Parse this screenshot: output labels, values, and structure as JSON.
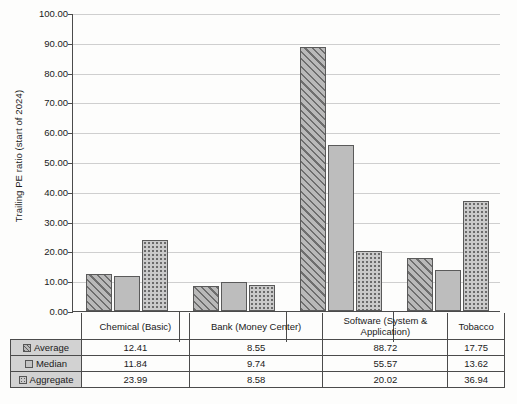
{
  "chart_data": {
    "type": "bar",
    "title": "",
    "xlabel": "",
    "ylabel": "Trailing PE ratio (start of 2024)",
    "ylim": [
      0,
      100
    ],
    "ytick_values": [
      0,
      10,
      20,
      30,
      40,
      50,
      60,
      70,
      80,
      90,
      100
    ],
    "ytick_labels": [
      "0.00",
      "10.00",
      "20.00",
      "30.00",
      "40.00",
      "50.00",
      "60.00",
      "70.00",
      "80.00",
      "90.00",
      "100.00"
    ],
    "grid": true,
    "legend_position": "table-below",
    "categories": [
      "Chemical (Basic)",
      "Bank (Money Center)",
      "Software (System & Application)",
      "Tobacco"
    ],
    "category_lines": [
      [
        "Chemical (Basic)"
      ],
      [
        "Bank (Money Center)"
      ],
      [
        "Software (System &",
        "Application)"
      ],
      [
        "Tobacco"
      ]
    ],
    "series": [
      {
        "name": "Average",
        "pattern": "diagonal-hatch",
        "color": "#b9b9b9",
        "values": [
          12.41,
          8.55,
          88.72,
          17.75
        ],
        "labels": [
          "12.41",
          "8.55",
          "88.72",
          "17.75"
        ]
      },
      {
        "name": "Median",
        "pattern": "solid-gray",
        "color": "#bdbdbd",
        "values": [
          11.84,
          9.74,
          55.57,
          13.62
        ],
        "labels": [
          "11.84",
          "9.74",
          "55.57",
          "13.62"
        ]
      },
      {
        "name": "Aggregate",
        "pattern": "dotted",
        "color": "#cacaca",
        "values": [
          23.99,
          8.58,
          20.02,
          36.94
        ],
        "labels": [
          "23.99",
          "8.58",
          "20.02",
          "36.94"
        ]
      }
    ]
  },
  "table": {
    "rows": [
      {
        "label": "Average",
        "cells": [
          "12.41",
          "8.55",
          "88.72",
          "17.75"
        ]
      },
      {
        "label": "Median",
        "cells": [
          "11.84",
          "9.74",
          "55.57",
          "13.62"
        ]
      },
      {
        "label": "Aggregate",
        "cells": [
          "23.99",
          "8.58",
          "20.02",
          "36.94"
        ]
      }
    ]
  }
}
